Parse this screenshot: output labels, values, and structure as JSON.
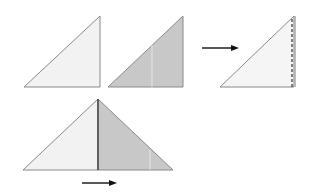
{
  "diagram": {
    "colors": {
      "light_paper": "#f2f2f2",
      "dark_paper": "#c8c8c8",
      "edge": "#8a8a8a",
      "crease_line": "#333333",
      "arrow": "#111111",
      "highlight_line": "#f4f4f4"
    },
    "steps": [
      {
        "id": "step-1",
        "description": "Light triangle (front side)"
      },
      {
        "id": "step-2",
        "description": "Grey triangle (back side) with faint crease"
      },
      {
        "id": "step-3",
        "description": "Fold arrow pointing right to triangle with dashed fold line"
      },
      {
        "id": "step-4",
        "description": "Opened triangle: light left half, grey right half with center crease"
      },
      {
        "id": "step-5",
        "description": "Arrow pointing right below opened triangle"
      }
    ]
  }
}
